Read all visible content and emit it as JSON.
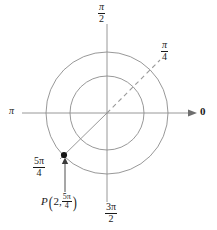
{
  "figure": {
    "kind": "polar-coordinate-diagram",
    "background_color": "#ffffff",
    "line_color": "#808080",
    "axis_color": "#808080",
    "text_color": "#1a1a1a",
    "point_color": "#111111"
  },
  "axes": {
    "center": {
      "x": 107,
      "y": 113
    },
    "horizontal": {
      "left_label": "π",
      "right_label": "0",
      "right_has_arrow": true,
      "x_start": 22,
      "x_end": 197
    },
    "vertical": {
      "top_label_numerator": "π",
      "top_label_denominator": "2",
      "bottom_label_numerator": "3π",
      "bottom_label_denominator": "2",
      "y_start": 24,
      "y_end": 202
    }
  },
  "circles": [
    {
      "name": "inner-circle",
      "radius": 37,
      "label": "r = 1"
    },
    {
      "name": "outer-circle",
      "radius": 61,
      "label": "r = 2"
    }
  ],
  "rays": [
    {
      "name": "pi-over-4-ray",
      "style": "dashed",
      "angle_degrees": 45,
      "label_numerator": "π",
      "label_denominator": "4",
      "end": {
        "x": 160,
        "y": 60
      }
    },
    {
      "name": "five-pi-over-4-ray",
      "style": "solid",
      "angle_degrees": 225,
      "label_numerator": "5π",
      "label_denominator": "4",
      "end": {
        "x": 64,
        "y": 155
      }
    }
  ],
  "point": {
    "name": "point-p",
    "x": 64,
    "y": 155,
    "radius_value": "2",
    "angle_numerator": "5π",
    "angle_denominator": "4",
    "label_prefix": "P",
    "label_open_paren": "(",
    "label_close_paren": ")",
    "label_separator": ",",
    "label_text": "P(2, 5π/4)"
  },
  "annotation_arrow": {
    "name": "point-callout-arrow",
    "from": {
      "x": 65,
      "y": 192
    },
    "to": {
      "x": 65,
      "y": 159
    }
  }
}
